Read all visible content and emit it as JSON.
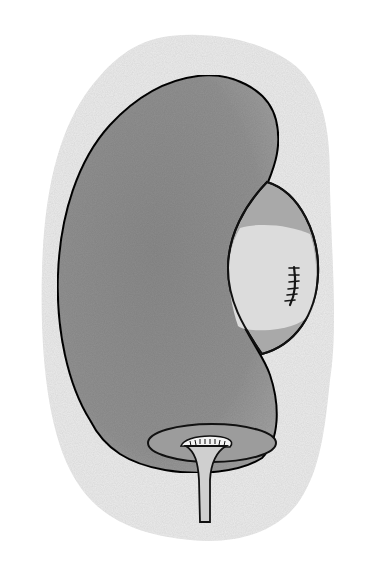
{
  "figure": {
    "title": "Kidney with sutured cyst illustration",
    "subject": "kidney",
    "elements": [
      "background-halo",
      "kidney-body",
      "cyst",
      "suture",
      "renal-hilum",
      "ureter"
    ],
    "suture_stitch_count": 6
  },
  "colors": {
    "background": "#ffffff",
    "halo": "#ececec",
    "kidney_fill": "#8f8f8f",
    "kidney_outline": "#111111",
    "cyst_outer_fill": "#a9a9a9",
    "cyst_inner_fill": "#dcdcdc",
    "hilum_fill": "#9c9c9c",
    "ureter_fill": "#cfcfcf",
    "suture": "#151515"
  }
}
